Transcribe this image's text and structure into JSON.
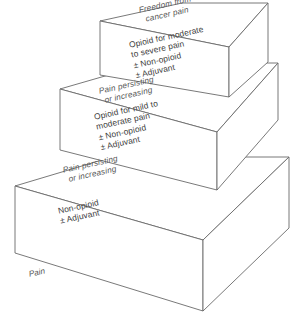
{
  "diagram": {
    "type": "3d-step-ladder",
    "background_color": "#ffffff",
    "line_color": "#6a6a6a",
    "text_color": "#3d3d3d",
    "base_label": "Pain",
    "steps": [
      {
        "level": 1,
        "name": "step-1-non-opioid",
        "top_label_line1": "Pain persisting",
        "top_label_line2": "or increasing",
        "face_lines": [
          "Non-opioid",
          "± Adjuvant"
        ]
      },
      {
        "level": 2,
        "name": "step-2-weak-opioid",
        "top_label_line1": "Pain persisting",
        "top_label_line2": "or increasing",
        "face_lines": [
          "Opioid for mild to",
          "moderate pain",
          "± Non-opioid",
          "± Adjuvant"
        ]
      },
      {
        "level": 3,
        "name": "step-3-strong-opioid",
        "top_label_line1": "Freedom from",
        "top_label_line2": "cancer pain",
        "face_lines": [
          "Opioid for moderate",
          "to severe pain",
          "± Non-opioid",
          "± Adjuvant"
        ]
      }
    ]
  }
}
